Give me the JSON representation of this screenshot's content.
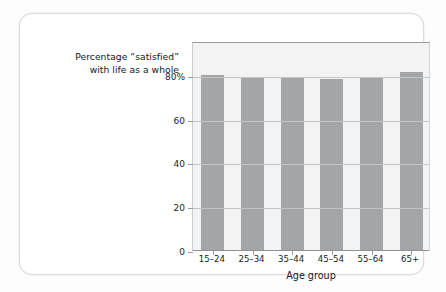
{
  "chart_data": {
    "type": "bar",
    "title_lines": [
      "Percentage “satisfied”",
      "with life as a whole"
    ],
    "categories": [
      "15–24",
      "25–34",
      "35–44",
      "45–54",
      "55–64",
      "65+"
    ],
    "values": [
      80.5,
      79,
      79,
      78.5,
      79,
      82
    ],
    "xlabel": "Age group",
    "ylabel": "",
    "ylim": [
      0,
      100
    ],
    "yticks": [
      0,
      20,
      40,
      60,
      80
    ],
    "ytick_labels": [
      "0",
      "20",
      "40",
      "60",
      "80%"
    ],
    "grid": true,
    "legend": "none",
    "colors": {
      "bar": "#a3a5a6",
      "plot_background": "#f3f3f3",
      "gridline": "#c2c4c5",
      "axis": "#8f9294",
      "text": "#15181a",
      "card_border": "#d8dcdd",
      "page_background": "#fdfdfd"
    }
  }
}
